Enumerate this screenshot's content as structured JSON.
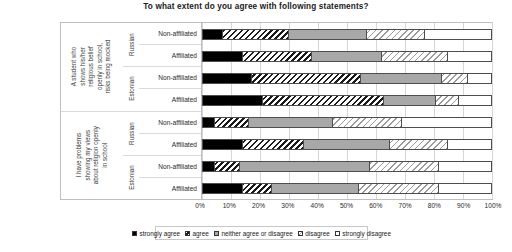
{
  "chart_data": {
    "type": "bar",
    "orientation": "horizontal",
    "stacked": true,
    "stacked_mode": "percent",
    "title": "To what extent do you agree with following statements?",
    "xlabel": "",
    "ylabel": "",
    "xlim": [
      0,
      100
    ],
    "grid": true,
    "legend_position": "bottom",
    "xticks": [
      "0%",
      "10%",
      "20%",
      "30%",
      "40%",
      "50%",
      "60%",
      "70%",
      "80%",
      "90%",
      "100%"
    ],
    "xtick_values": [
      0,
      10,
      20,
      30,
      40,
      50,
      60,
      70,
      80,
      90,
      100
    ],
    "legend": [
      "strongly agree",
      "agree",
      "neither agree or disagree",
      "disagree",
      "strongly disagree"
    ],
    "series": [
      {
        "name": "strongly agree",
        "values": [
          7,
          14,
          17,
          21,
          4,
          14,
          4,
          14
        ]
      },
      {
        "name": "agree",
        "values": [
          23,
          24,
          38,
          42,
          12,
          21,
          9,
          10
        ]
      },
      {
        "name": "neither agree or disagree",
        "values": [
          27,
          24,
          28,
          18,
          29,
          30,
          45,
          30
        ]
      },
      {
        "name": "disagree",
        "values": [
          20,
          23,
          9,
          8,
          24,
          20,
          24,
          28
        ]
      },
      {
        "name": "strongly disagree",
        "values": [
          23,
          15,
          8,
          11,
          31,
          15,
          18,
          18
        ]
      }
    ],
    "groups": [
      {
        "statement": "A student who shows his/her religious belief openly in school, risks being mocked",
        "statement_lines": [
          "A student who",
          "shows his/her",
          "religious belief",
          "openly in school,",
          "risks being mocked"
        ],
        "languages": [
          {
            "label": "Russian",
            "rows": [
              "Non-affiliated",
              "Affiliated"
            ]
          },
          {
            "label": "Estonian",
            "rows": [
              "Non-affiliated",
              "Affiliated"
            ]
          }
        ]
      },
      {
        "statement": "I have problems showing my views about religion openly in school",
        "statement_lines": [
          "I have problems",
          "showing my views",
          "about religion openly",
          "in school"
        ],
        "languages": [
          {
            "label": "Russian",
            "rows": [
              "Non-affiliated",
              "Affiliated"
            ]
          },
          {
            "label": "Estonian",
            "rows": [
              "Non-affiliated",
              "Affiliated"
            ]
          }
        ]
      }
    ],
    "rows": [
      {
        "statement_index": 0,
        "language": "Russian",
        "affiliation": "Non-affiliated",
        "values": [
          7,
          23,
          27,
          20,
          23
        ]
      },
      {
        "statement_index": 0,
        "language": "Russian",
        "affiliation": "Affiliated",
        "values": [
          14,
          24,
          24,
          23,
          15
        ]
      },
      {
        "statement_index": 0,
        "language": "Estonian",
        "affiliation": "Non-affiliated",
        "values": [
          17,
          38,
          28,
          9,
          8
        ]
      },
      {
        "statement_index": 0,
        "language": "Estonian",
        "affiliation": "Affiliated",
        "values": [
          21,
          42,
          18,
          8,
          11
        ]
      },
      {
        "statement_index": 1,
        "language": "Russian",
        "affiliation": "Non-affiliated",
        "values": [
          4,
          12,
          29,
          24,
          31
        ]
      },
      {
        "statement_index": 1,
        "language": "Russian",
        "affiliation": "Affiliated",
        "values": [
          14,
          21,
          30,
          20,
          15
        ]
      },
      {
        "statement_index": 1,
        "language": "Estonian",
        "affiliation": "Non-affiliated",
        "values": [
          4,
          9,
          45,
          24,
          18
        ]
      },
      {
        "statement_index": 1,
        "language": "Estonian",
        "affiliation": "Affiliated",
        "values": [
          14,
          10,
          30,
          28,
          18
        ]
      }
    ],
    "colors": {
      "strongly_agree": "#000000",
      "agree": "#ffffff",
      "neither": "#a8a8a8",
      "disagree": "#ffffff",
      "strongly_disagree": "#ffffff"
    }
  }
}
